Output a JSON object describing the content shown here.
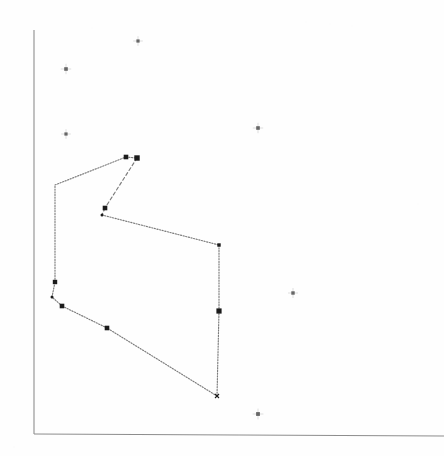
{
  "figure": {
    "title": "",
    "subtitle": "",
    "background_color": "#fefefe",
    "ink_color": "#7b7b7b",
    "vertex_color": "#1b1b1b",
    "scatter_color": "#676767",
    "axis_color": "#8d8d8d",
    "width": 444,
    "height": 456
  },
  "axes": {
    "x_axis": {
      "label": "",
      "tick_labels": [],
      "origin_px": [
        34,
        434
      ],
      "end_px": [
        444,
        436
      ]
    },
    "y_axis": {
      "label": "",
      "tick_labels": [],
      "origin_px": [
        34,
        434
      ],
      "end_px": [
        34,
        30
      ]
    },
    "grid": false,
    "legend": null
  },
  "chart_data": {
    "type": "scatter",
    "title": "",
    "xlabel": "",
    "ylabel": "",
    "xlim": [
      0,
      444
    ],
    "ylim": [
      0,
      456
    ],
    "grid": false,
    "legend_position": "none",
    "series": [
      {
        "name": "polygon-hull",
        "type": "polygon",
        "closed": true,
        "stroke_style": "dotted",
        "x": [
          126,
          137,
          105,
          102,
          219,
          219,
          217,
          107,
          62,
          52,
          55,
          55
        ],
        "y": [
          157,
          158,
          208,
          215,
          245,
          311,
          396,
          328,
          306,
          297,
          282,
          185
        ],
        "vertices": [
          {
            "id": "v1",
            "x": 126,
            "y": 157,
            "marker": "square",
            "size": 4.6
          },
          {
            "id": "v2",
            "x": 137,
            "y": 158,
            "marker": "square",
            "size": 5.4
          },
          {
            "id": "v3",
            "x": 105,
            "y": 208,
            "marker": "square",
            "size": 4.6
          },
          {
            "id": "v4",
            "x": 102,
            "y": 215,
            "marker": "dot",
            "size": 3.0
          },
          {
            "id": "v5",
            "x": 219,
            "y": 245,
            "marker": "square",
            "size": 3.4
          },
          {
            "id": "v6",
            "x": 219,
            "y": 311,
            "marker": "square",
            "size": 5.2
          },
          {
            "id": "v7",
            "x": 217,
            "y": 396,
            "marker": "cross",
            "size": 4.0
          },
          {
            "id": "v8",
            "x": 107,
            "y": 328,
            "marker": "square",
            "size": 4.6
          },
          {
            "id": "v9",
            "x": 62,
            "y": 306,
            "marker": "square",
            "size": 4.6
          },
          {
            "id": "v10",
            "x": 52,
            "y": 297,
            "marker": "dot",
            "size": 3.0
          },
          {
            "id": "v11",
            "x": 55,
            "y": 282,
            "marker": "square",
            "size": 4.4
          },
          {
            "id": "v12",
            "x": 55,
            "y": 185,
            "marker": "none",
            "size": 0
          }
        ],
        "edges": [
          {
            "from": "v1",
            "to": "v2",
            "style": "dotted"
          },
          {
            "from": "v2",
            "to": "v3",
            "style": "dashed"
          },
          {
            "from": "v3",
            "to": "v4",
            "style": "dashed"
          },
          {
            "from": "v4",
            "to": "v5",
            "style": "dotted"
          },
          {
            "from": "v5",
            "to": "v6",
            "style": "dotted"
          },
          {
            "from": "v6",
            "to": "v7",
            "style": "dotted"
          },
          {
            "from": "v7",
            "to": "v8",
            "style": "dotted"
          },
          {
            "from": "v8",
            "to": "v9",
            "style": "dotted"
          },
          {
            "from": "v9",
            "to": "v10",
            "style": "dotted"
          },
          {
            "from": "v10",
            "to": "v11",
            "style": "dotted"
          },
          {
            "from": "v11",
            "to": "v12",
            "style": "dotted"
          },
          {
            "from": "v12",
            "to": "v1",
            "style": "dotted"
          }
        ]
      },
      {
        "name": "outlier-points",
        "type": "scatter",
        "marker": "cross-dot",
        "x": [
          138,
          66,
          66,
          258,
          293,
          258
        ],
        "y": [
          41,
          69,
          134,
          128,
          293,
          414
        ],
        "points": [
          {
            "id": "p1",
            "x": 138,
            "y": 41,
            "marker": "cross-dot",
            "size": 3.2
          },
          {
            "id": "p2",
            "x": 66,
            "y": 69,
            "marker": "cross-dot",
            "size": 3.6
          },
          {
            "id": "p3",
            "x": 66,
            "y": 134,
            "marker": "cross-dot",
            "size": 3.2
          },
          {
            "id": "p4",
            "x": 258,
            "y": 128,
            "marker": "cross-dot",
            "size": 3.6
          },
          {
            "id": "p5",
            "x": 293,
            "y": 293,
            "marker": "cross-dot",
            "size": 3.4
          },
          {
            "id": "p6",
            "x": 258,
            "y": 414,
            "marker": "cross-dot",
            "size": 3.8
          }
        ]
      }
    ],
    "specks": [
      {
        "x": 14,
        "y": 447,
        "r": 1.1
      },
      {
        "x": 306,
        "y": 22,
        "r": 0.9
      },
      {
        "x": 330,
        "y": 24,
        "r": 0.9
      },
      {
        "x": 352,
        "y": 26,
        "r": 0.8
      },
      {
        "x": 418,
        "y": 204,
        "r": 0.8
      },
      {
        "x": 92,
        "y": 28,
        "r": 0.7
      }
    ]
  }
}
